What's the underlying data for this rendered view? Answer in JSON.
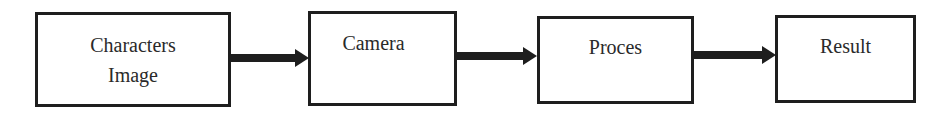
{
  "diagram": {
    "type": "flowchart",
    "direction": "left-to-right",
    "nodes": [
      {
        "id": "n1",
        "line1": "Characters",
        "line2": "Image"
      },
      {
        "id": "n2",
        "line1": "Camera",
        "line2": ""
      },
      {
        "id": "n3",
        "line1": "Proces",
        "line2": ""
      },
      {
        "id": "n4",
        "line1": "Result",
        "line2": ""
      }
    ],
    "edges": [
      {
        "from": "n1",
        "to": "n2"
      },
      {
        "from": "n2",
        "to": "n3"
      },
      {
        "from": "n3",
        "to": "n4"
      }
    ],
    "colors": {
      "stroke": "#1e1e1e",
      "text": "#2a2a2a",
      "background": "#ffffff"
    }
  }
}
